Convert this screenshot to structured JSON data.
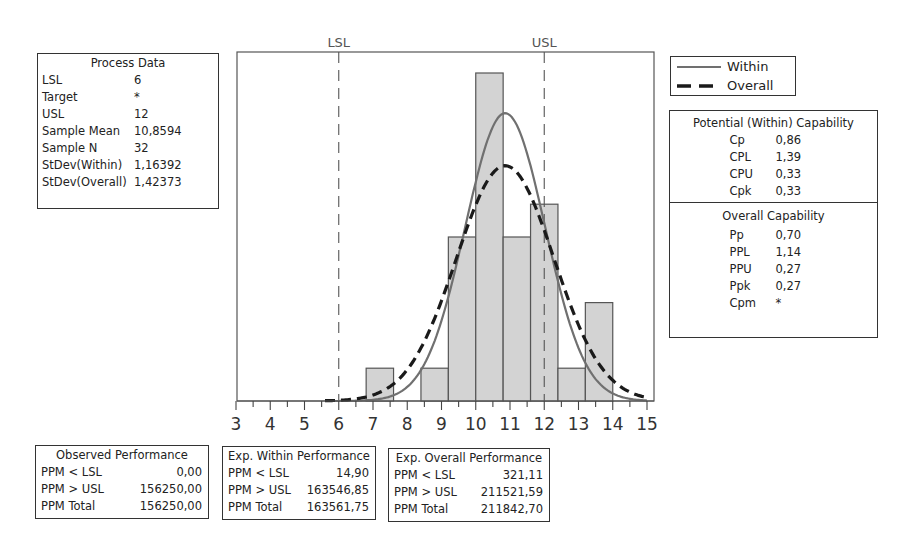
{
  "process_data": {
    "title": "Process Data",
    "rows": [
      {
        "label": "LSL",
        "value": "6"
      },
      {
        "label": "Target",
        "value": "*"
      },
      {
        "label": "USL",
        "value": "12"
      },
      {
        "label": "Sample Mean",
        "value": "10,8594"
      },
      {
        "label": "Sample N",
        "value": "32"
      },
      {
        "label": "StDev(Within)",
        "value": "1,16392"
      },
      {
        "label": "StDev(Overall)",
        "value": "1,42373"
      }
    ]
  },
  "legend": {
    "within": "Within",
    "overall": "Overall"
  },
  "potential_capability": {
    "title": "Potential (Within) Capability",
    "rows": [
      {
        "label": "Cp",
        "value": "0,86"
      },
      {
        "label": "CPL",
        "value": "1,39"
      },
      {
        "label": "CPU",
        "value": "0,33"
      },
      {
        "label": "Cpk",
        "value": "0,33"
      }
    ]
  },
  "overall_capability": {
    "title": "Overall Capability",
    "rows": [
      {
        "label": "Pp",
        "value": "0,70"
      },
      {
        "label": "PPL",
        "value": "1,14"
      },
      {
        "label": "PPU",
        "value": "0,27"
      },
      {
        "label": "Ppk",
        "value": "0,27"
      },
      {
        "label": "Cpm",
        "value": "*"
      }
    ]
  },
  "observed_performance": {
    "title": "Observed Performance",
    "rows": [
      {
        "label": "PPM < LSL",
        "value": "0,00"
      },
      {
        "label": "PPM > USL",
        "value": "156250,00"
      },
      {
        "label": "PPM Total",
        "value": "156250,00"
      }
    ]
  },
  "exp_within_performance": {
    "title": "Exp. Within Performance",
    "rows": [
      {
        "label": "PPM < LSL",
        "value": "14,90"
      },
      {
        "label": "PPM > USL",
        "value": "163546,85"
      },
      {
        "label": "PPM Total",
        "value": "163561,75"
      }
    ]
  },
  "exp_overall_performance": {
    "title": "Exp. Overall Performance",
    "rows": [
      {
        "label": "PPM < LSL",
        "value": "321,11"
      },
      {
        "label": "PPM > USL",
        "value": "211521,59"
      },
      {
        "label": "PPM Total",
        "value": "211842,70"
      }
    ]
  },
  "chart_data": {
    "type": "bar",
    "xlabel": "",
    "ylabel": "",
    "xlim": [
      3,
      15
    ],
    "x_ticks": [
      3,
      4,
      5,
      6,
      7,
      8,
      9,
      10,
      11,
      12,
      13,
      14,
      15
    ],
    "bin_width": 0.8,
    "bins": [
      {
        "start": 6.8,
        "end": 7.6,
        "count": 1
      },
      {
        "start": 7.6,
        "end": 8.4,
        "count": 0
      },
      {
        "start": 8.4,
        "end": 9.2,
        "count": 1
      },
      {
        "start": 9.2,
        "end": 10.0,
        "count": 5
      },
      {
        "start": 10.0,
        "end": 10.8,
        "count": 10
      },
      {
        "start": 10.8,
        "end": 11.6,
        "count": 5
      },
      {
        "start": 11.6,
        "end": 12.4,
        "count": 6
      },
      {
        "start": 12.4,
        "end": 13.2,
        "count": 1
      },
      {
        "start": 13.2,
        "end": 14.0,
        "count": 3
      }
    ],
    "spec_lines": [
      {
        "name": "LSL",
        "x": 6
      },
      {
        "name": "USL",
        "x": 12
      }
    ],
    "curves": [
      {
        "name": "Within",
        "type": "normal",
        "mean": 10.8594,
        "stdev": 1.16392,
        "style": "solid",
        "color": "#707070"
      },
      {
        "name": "Overall",
        "type": "normal",
        "mean": 10.8594,
        "stdev": 1.42373,
        "style": "dashed",
        "color": "#1a1a1a"
      }
    ],
    "sample_n": 32,
    "grid": false,
    "legend_position": "right",
    "colors": {
      "bar_fill": "#d3d3d3",
      "bar_edge": "#555555",
      "frame": "#555555"
    }
  }
}
